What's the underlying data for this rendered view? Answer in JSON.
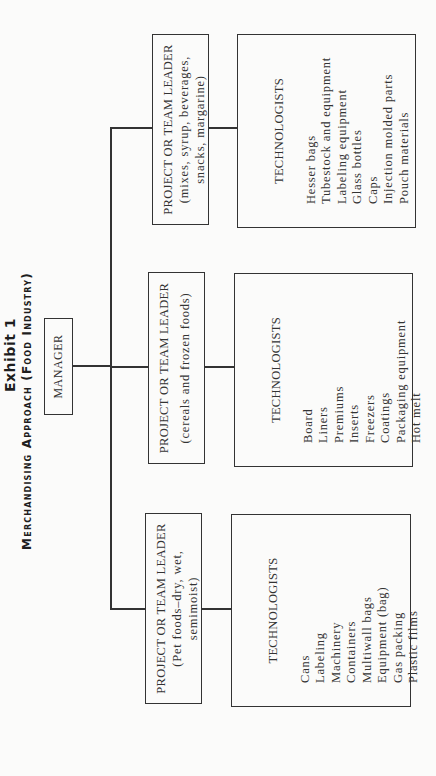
{
  "header": {
    "exhibit": "Exhibit 1",
    "subtitle": "Merchandising Approach (Food Industry)"
  },
  "manager": {
    "label": "MANAGER"
  },
  "teams": [
    {
      "role": "PROJECT OR TEAM LEADER",
      "desc_line1": "(Pet foods–dry, wet,",
      "desc_line2": "semimoist)",
      "technologists": {
        "header": "TECHNOLOGISTS",
        "items": [
          "Cans",
          "Labeling",
          "Machinery",
          "Containers",
          "Multiwall bags",
          "Equipment (bag)",
          "Gas packing",
          "Plastic films"
        ]
      }
    },
    {
      "role": "PROJECT OR TEAM LEADER",
      "desc_line1": "(cereals and frozen foods)",
      "desc_line2": "",
      "technologists": {
        "header": "TECHNOLOGISTS",
        "items": [
          "Board",
          "Liners",
          "Premiums",
          "Inserts",
          "Freezers",
          "Coatings",
          "Packaging equipment",
          "Hot melt"
        ]
      }
    },
    {
      "role": "PROJECT OR TEAM LEADER",
      "desc_line1": "(mixes, syrup, beverages,",
      "desc_line2": "snacks, margarine)",
      "technologists": {
        "header": "TECHNOLOGISTS",
        "items": [
          "Hesser bags",
          "Tubestock and equipment",
          "Labeling equipment",
          "Glass bottles",
          "Caps",
          "Injection molded parts",
          "Pouch materials"
        ]
      }
    }
  ],
  "colors": {
    "line": "#333333",
    "background": "#fbfbfa",
    "text": "#2a2a2a"
  }
}
